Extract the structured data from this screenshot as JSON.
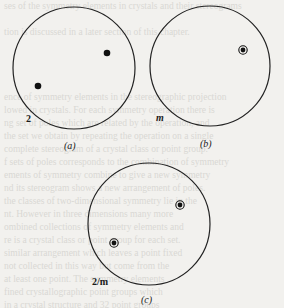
{
  "figure": {
    "panels": [
      {
        "id": "a",
        "caption": "(a)",
        "symbol_label": "2",
        "center": [
          74,
          68
        ],
        "radius": 61,
        "poles": [
          {
            "x": 107,
            "y": 53,
            "type": "dot"
          },
          {
            "x": 38,
            "y": 86,
            "type": "dot"
          }
        ]
      },
      {
        "id": "b",
        "caption": "(b)",
        "symbol_label": "m",
        "center": [
          210,
          66
        ],
        "radius": 60,
        "poles": [
          {
            "x": 243,
            "y": 50,
            "type": "dot-circle"
          }
        ]
      },
      {
        "id": "c",
        "caption": "(c)",
        "symbol_label": "2/m",
        "center": [
          149,
          224
        ],
        "radius": 61,
        "poles": [
          {
            "x": 180,
            "y": 205,
            "type": "dot-circle"
          },
          {
            "x": 114,
            "y": 243,
            "type": "dot-circle"
          }
        ]
      }
    ]
  },
  "labels": {
    "a_symbol": "2",
    "a_caption": "(a)",
    "b_symbol": "m",
    "b_caption": "(b)",
    "c_symbol": "2/m",
    "c_caption": "(c)"
  }
}
